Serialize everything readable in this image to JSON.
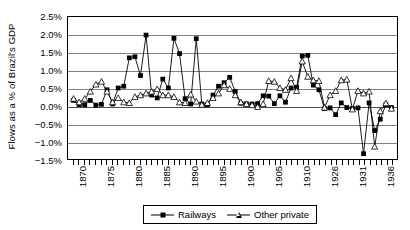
{
  "chart_data": {
    "type": "line",
    "title": "",
    "xlabel": "",
    "ylabel": "Flows as a % of Brazil's GDP",
    "ylim": [
      -1.5,
      2.5
    ],
    "ytick_labels": [
      "2.5%",
      "2.0%",
      "1.5%",
      "1.0%",
      "0.5%",
      "0.0%",
      "-0.5%",
      "-1.0%",
      "-1.5%"
    ],
    "ytick_values": [
      2.5,
      2.0,
      1.5,
      1.0,
      0.5,
      0.0,
      -0.5,
      -1.0,
      -1.5
    ],
    "xtick_labels": [
      "1870",
      "1875",
      "1880",
      "1885",
      "1890",
      "1895",
      "1900",
      "1905",
      "1910",
      "1926",
      "1931",
      "1936"
    ],
    "xtick_values": [
      1870,
      1875,
      1880,
      1885,
      1890,
      1895,
      1900,
      1905,
      1910,
      1926,
      1931,
      1936
    ],
    "x_categories": [
      1870,
      1871,
      1872,
      1873,
      1874,
      1875,
      1876,
      1877,
      1878,
      1879,
      1880,
      1881,
      1882,
      1883,
      1884,
      1885,
      1886,
      1887,
      1888,
      1889,
      1890,
      1891,
      1892,
      1893,
      1894,
      1895,
      1896,
      1897,
      1898,
      1899,
      1900,
      1901,
      1902,
      1903,
      1904,
      1905,
      1906,
      1907,
      1908,
      1909,
      1910,
      1911,
      1912,
      1913,
      1925,
      1926,
      1927,
      1928,
      1929,
      1930,
      1931,
      1932,
      1933,
      1934,
      1935,
      1936,
      1937,
      1938
    ],
    "grid": true,
    "legend_position": "bottom",
    "series": [
      {
        "name": "Railways",
        "marker": "filled-square",
        "x": [
          1870,
          1871,
          1872,
          1873,
          1874,
          1875,
          1876,
          1877,
          1878,
          1879,
          1880,
          1881,
          1882,
          1883,
          1884,
          1885,
          1886,
          1887,
          1888,
          1889,
          1890,
          1891,
          1892,
          1893,
          1894,
          1895,
          1896,
          1897,
          1898,
          1899,
          1900,
          1901,
          1902,
          1903,
          1904,
          1905,
          1906,
          1907,
          1908,
          1909,
          1910,
          1911,
          1912,
          1913,
          1925,
          1926,
          1927,
          1928,
          1929,
          1930,
          1931,
          1932,
          1933,
          1934,
          1935,
          1936,
          1937,
          1938
        ],
        "values": [
          0.15,
          0.03,
          0.03,
          0.15,
          0.02,
          0.04,
          0.45,
          0.05,
          0.5,
          0.55,
          1.35,
          1.38,
          0.85,
          1.99,
          0.3,
          0.22,
          0.75,
          0.5,
          1.9,
          1.47,
          0.2,
          0.05,
          1.89,
          0.05,
          0.03,
          0.3,
          0.55,
          0.65,
          0.8,
          0.4,
          0.07,
          0.05,
          0.05,
          0.06,
          0.28,
          0.27,
          0.06,
          0.28,
          0.1,
          0.5,
          0.52,
          1.4,
          1.42,
          0.58,
          0.45,
          -0.08,
          -0.06,
          -0.25,
          0.08,
          -0.05,
          -0.08,
          -0.06,
          -1.35,
          0.08,
          -0.7,
          -0.38,
          0.03,
          -0.05
        ]
      },
      {
        "name": "Other private",
        "marker": "open-triangle",
        "x": [
          1870,
          1871,
          1872,
          1873,
          1874,
          1875,
          1876,
          1877,
          1878,
          1879,
          1880,
          1881,
          1882,
          1883,
          1884,
          1885,
          1886,
          1887,
          1888,
          1889,
          1890,
          1891,
          1892,
          1893,
          1894,
          1895,
          1896,
          1897,
          1898,
          1899,
          1900,
          1901,
          1902,
          1903,
          1904,
          1905,
          1906,
          1907,
          1908,
          1909,
          1910,
          1911,
          1912,
          1913,
          1925,
          1926,
          1927,
          1928,
          1929,
          1930,
          1931,
          1932,
          1933,
          1934,
          1935,
          1936,
          1937,
          1938
        ],
        "values": [
          0.2,
          0.1,
          0.2,
          0.4,
          0.6,
          0.68,
          0.4,
          0.1,
          0.22,
          0.1,
          0.08,
          0.25,
          0.3,
          0.35,
          0.4,
          0.47,
          0.3,
          0.3,
          0.25,
          0.1,
          0.08,
          0.32,
          0.12,
          0.03,
          0.08,
          0.22,
          0.35,
          0.58,
          0.48,
          0.3,
          0.1,
          0.05,
          0.02,
          -0.03,
          0.05,
          0.7,
          0.68,
          0.5,
          0.45,
          0.78,
          0.42,
          1.25,
          0.82,
          0.72,
          0.7,
          -0.05,
          0.3,
          0.42,
          0.72,
          0.74,
          -0.1,
          0.42,
          0.35,
          0.4,
          -1.15,
          -0.15,
          0.07,
          -0.08
        ]
      }
    ]
  },
  "legend": {
    "items": [
      {
        "label": "Railways"
      },
      {
        "label": "Other private"
      }
    ]
  }
}
